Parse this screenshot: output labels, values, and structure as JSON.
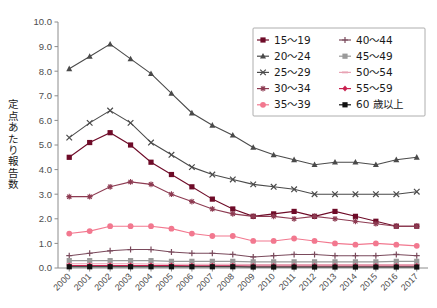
{
  "chart_data": {
    "type": "line",
    "title": "",
    "xlabel": "",
    "ylabel": "定点あたり報告数",
    "ylim": [
      0.0,
      10.0
    ],
    "ytick_step": 1.0,
    "yticks": [
      "0.0",
      "1.0",
      "2.0",
      "3.0",
      "4.0",
      "5.0",
      "6.0",
      "7.0",
      "8.0",
      "9.0",
      "10.0"
    ],
    "grid": false,
    "legend_position": "top-right",
    "x": [
      2000,
      2001,
      2002,
      2003,
      2004,
      2005,
      2006,
      2007,
      2008,
      2009,
      2010,
      2011,
      2012,
      2013,
      2014,
      2015,
      2016,
      2017
    ],
    "categories": [
      "2000",
      "2001",
      "2002",
      "2003",
      "2004",
      "2005",
      "2006",
      "2007",
      "2008",
      "2009",
      "2010",
      "2011",
      "2012",
      "2013",
      "2014",
      "2015",
      "2016",
      "2017"
    ],
    "series": [
      {
        "name": "15～19",
        "color": "#6e0b28",
        "marker": "square",
        "values": [
          4.5,
          5.1,
          5.5,
          5.0,
          4.3,
          3.8,
          3.3,
          2.8,
          2.4,
          2.1,
          2.2,
          2.3,
          2.1,
          2.3,
          2.1,
          1.9,
          1.7,
          1.7
        ]
      },
      {
        "name": "20～24",
        "color": "#4a4a4a",
        "marker": "triangle",
        "values": [
          8.1,
          8.6,
          9.1,
          8.5,
          7.9,
          7.1,
          6.3,
          5.8,
          5.4,
          4.9,
          4.6,
          4.4,
          4.2,
          4.3,
          4.3,
          4.2,
          4.4,
          4.5
        ]
      },
      {
        "name": "25～29",
        "color": "#4a4a4a",
        "marker": "cross",
        "values": [
          5.3,
          5.9,
          6.4,
          5.9,
          5.1,
          4.6,
          4.1,
          3.8,
          3.6,
          3.4,
          3.3,
          3.2,
          3.0,
          3.0,
          3.0,
          3.0,
          3.0,
          3.1
        ]
      },
      {
        "name": "30～34",
        "color": "#8d3b52",
        "marker": "star",
        "values": [
          2.9,
          2.9,
          3.3,
          3.5,
          3.4,
          3.0,
          2.7,
          2.4,
          2.2,
          2.1,
          2.1,
          2.0,
          2.1,
          2.0,
          1.9,
          1.8,
          1.7,
          1.7
        ]
      },
      {
        "name": "35～39",
        "color": "#f2788f",
        "marker": "circle",
        "values": [
          1.4,
          1.5,
          1.7,
          1.7,
          1.7,
          1.6,
          1.4,
          1.3,
          1.3,
          1.1,
          1.1,
          1.2,
          1.1,
          1.0,
          0.95,
          1.0,
          0.95,
          0.9
        ]
      },
      {
        "name": "40～44",
        "color": "#7a4a5c",
        "marker": "plus",
        "values": [
          0.5,
          0.6,
          0.7,
          0.75,
          0.75,
          0.65,
          0.6,
          0.6,
          0.55,
          0.45,
          0.5,
          0.55,
          0.55,
          0.5,
          0.5,
          0.5,
          0.55,
          0.5
        ]
      },
      {
        "name": "45～49",
        "color": "#9a9a9a",
        "marker": "square",
        "values": [
          0.3,
          0.3,
          0.3,
          0.3,
          0.3,
          0.27,
          0.27,
          0.27,
          0.27,
          0.25,
          0.25,
          0.25,
          0.25,
          0.25,
          0.25,
          0.25,
          0.27,
          0.27
        ]
      },
      {
        "name": "50～54",
        "color": "#e8a3b4",
        "marker": "dash",
        "values": [
          0.17,
          0.17,
          0.17,
          0.17,
          0.16,
          0.15,
          0.15,
          0.15,
          0.15,
          0.14,
          0.14,
          0.14,
          0.14,
          0.14,
          0.14,
          0.14,
          0.14,
          0.14
        ]
      },
      {
        "name": "55～59",
        "color": "#c9204f",
        "marker": "diamond",
        "values": [
          0.1,
          0.1,
          0.1,
          0.1,
          0.1,
          0.1,
          0.09,
          0.09,
          0.09,
          0.08,
          0.08,
          0.08,
          0.08,
          0.08,
          0.08,
          0.08,
          0.08,
          0.08
        ]
      },
      {
        "name": "60 歳以上",
        "color": "#111111",
        "marker": "square",
        "values": [
          0.05,
          0.05,
          0.05,
          0.05,
          0.05,
          0.05,
          0.05,
          0.05,
          0.05,
          0.04,
          0.04,
          0.04,
          0.04,
          0.04,
          0.04,
          0.04,
          0.04,
          0.04
        ]
      }
    ],
    "legend": {
      "columns": 2,
      "entries": [
        "15～19",
        "20～24",
        "25～29",
        "30～34",
        "35～39",
        "40～44",
        "45～49",
        "50～54",
        "55～59",
        "60 歳以上"
      ]
    }
  }
}
